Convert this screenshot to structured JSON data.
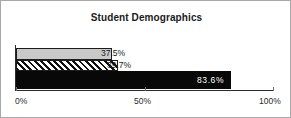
{
  "chart_data": {
    "type": "bar",
    "orientation": "horizontal",
    "title": "Student Demographics",
    "xlabel": "",
    "ylabel": "",
    "categories": [
      "Series 1",
      "Series 2",
      "Series 3"
    ],
    "values": [
      37.5,
      39.7,
      83.6
    ],
    "value_labels": [
      "37.5%",
      "39.7%",
      "83.6%"
    ],
    "xlim": [
      0,
      100
    ],
    "tick_labels": [
      "0%",
      "50%",
      "100%"
    ],
    "tick_values": [
      0,
      50,
      100
    ],
    "grid": false,
    "legend": false,
    "series_styles": [
      "solid-light-gray",
      "diagonal-hatch",
      "solid-black"
    ],
    "colors": {
      "bar_gray": "#c9c9c9",
      "bar_hatch_line": "#111111",
      "bar_black": "#080808",
      "axis": "#2b2b2b",
      "text": "#1a1a1a",
      "inside_label_text": "#ffffff",
      "frame_border": "#a8a8a8"
    }
  }
}
